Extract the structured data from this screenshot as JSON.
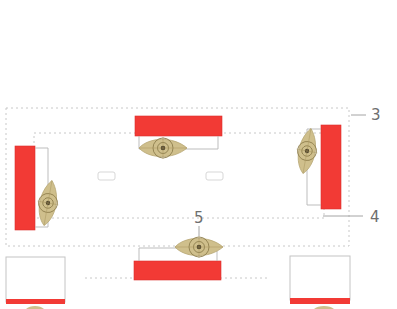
{
  "diagram": {
    "colors": {
      "bar": "#f23a35",
      "bar_edge": "#d9302c",
      "marker_fill": "#cfbf8c",
      "marker_ring": "#8f7f4e",
      "marker_dot": "#4a3f28",
      "dashed_line": "#c8c8c8",
      "connector_line": "#b5b5b5",
      "callout_text": "#6e6e6e",
      "box_outline": "#c4c4c4"
    },
    "callouts": [
      {
        "id": "3",
        "label": "3"
      },
      {
        "id": "4",
        "label": "4"
      },
      {
        "id": "5",
        "label": "5"
      }
    ],
    "bars": [
      {
        "name": "top-bar"
      },
      {
        "name": "left-bar"
      },
      {
        "name": "right-bar"
      },
      {
        "name": "bottom-bar"
      },
      {
        "name": "bottom-left-box-bar"
      },
      {
        "name": "bottom-right-box-bar"
      }
    ],
    "markers": [
      {
        "name": "top-marker"
      },
      {
        "name": "left-marker"
      },
      {
        "name": "right-marker"
      },
      {
        "name": "bottom-marker"
      }
    ]
  }
}
